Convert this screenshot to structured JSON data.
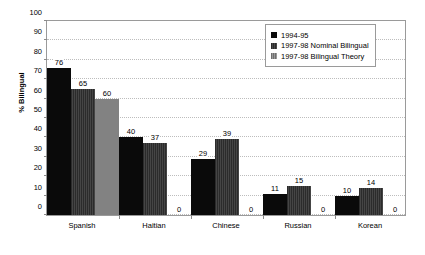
{
  "chart_data": {
    "type": "bar",
    "title": "",
    "xlabel": "",
    "ylabel": "% Bilingual",
    "ylim": [
      0,
      100
    ],
    "ytick_step": 10,
    "yticks": [
      100,
      90,
      80,
      70,
      60,
      50,
      40,
      30,
      20,
      10,
      0
    ],
    "grid": true,
    "legend_position": "top-right",
    "categories": [
      "Spanish",
      "Haitian",
      "Chinese",
      "Russian",
      "Korean"
    ],
    "series": [
      {
        "name": "1994-95",
        "color": "#0a0a0a",
        "values": [
          76,
          40,
          29,
          11,
          10
        ],
        "labels": [
          "76",
          "40",
          "29",
          "11",
          "10"
        ]
      },
      {
        "name": "1997-98 Nominal Bilingual",
        "color": "#333333",
        "values": [
          65,
          37,
          39,
          15,
          14
        ],
        "labels": [
          "65",
          "37",
          "39",
          "15",
          "14"
        ]
      },
      {
        "name": "1997-98 Bilingual Theory",
        "color": "#828282",
        "values": [
          60,
          0,
          0,
          0,
          0
        ],
        "labels": [
          "60",
          "0",
          "0",
          "0",
          "0"
        ]
      }
    ]
  },
  "legend": {
    "items": [
      {
        "label": "1994-95"
      },
      {
        "label": "1997-98 Nominal Bilingual"
      },
      {
        "label": "1997-98 Bilingual Theory"
      }
    ]
  }
}
